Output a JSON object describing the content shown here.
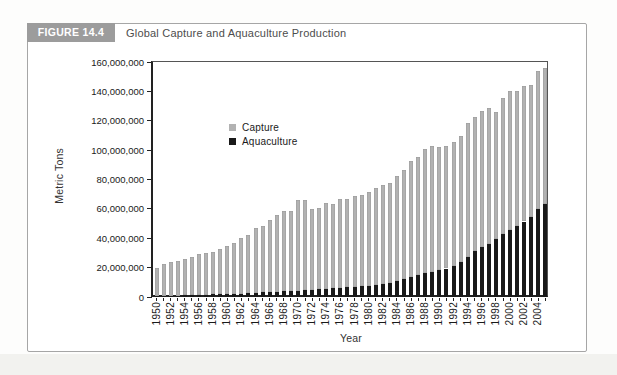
{
  "header": {
    "figure_label": "FIGURE 14.4",
    "title": "Global Capture and Aquaculture Production"
  },
  "chart_data": {
    "type": "bar",
    "stacked": true,
    "title": "Global Capture and Aquaculture Production",
    "xlabel": "Year",
    "ylabel": "Metric Tons",
    "ylim": [
      0,
      160000000
    ],
    "ytick_step": 20000000,
    "ytick_labels": [
      "0",
      "20,000,000",
      "40,000,000",
      "60,000,000",
      "80,000,000",
      "100,000,000",
      "120,000,000",
      "140,000,000",
      "160,000,000"
    ],
    "x_label_every": 2,
    "grid": false,
    "legend_position": "inside-upper-middle",
    "categories": [
      1950,
      1951,
      1952,
      1953,
      1954,
      1955,
      1956,
      1957,
      1958,
      1959,
      1960,
      1961,
      1962,
      1963,
      1964,
      1965,
      1966,
      1967,
      1968,
      1969,
      1970,
      1971,
      1972,
      1973,
      1974,
      1975,
      1976,
      1977,
      1978,
      1979,
      1980,
      1981,
      1982,
      1983,
      1984,
      1985,
      1986,
      1987,
      1988,
      1989,
      1990,
      1991,
      1992,
      1993,
      1994,
      1995,
      1996,
      1997,
      1998,
      1999,
      2000,
      2001,
      2002,
      2003,
      2004,
      2005
    ],
    "series": [
      {
        "name": "Capture",
        "color": "#b2b2b2",
        "values": [
          19200000,
          21500000,
          23000000,
          23600000,
          25000000,
          26200000,
          27600000,
          28000000,
          28500000,
          30400000,
          32400000,
          34900000,
          38100000,
          39700000,
          44200000,
          45400000,
          48900000,
          52300000,
          54800000,
          54300000,
          61400000,
          61600000,
          55200000,
          55200000,
          58300000,
          57700000,
          60500000,
          59700000,
          61600000,
          62000000,
          63800000,
          66100000,
          67500000,
          67600000,
          71600000,
          74500000,
          79200000,
          80100000,
          84600000,
          85500000,
          83900000,
          83400000,
          84200000,
          85700000,
          91100000,
          91400000,
          92500000,
          92900000,
          86800000,
          92800000,
          94600000,
          91900000,
          92200000,
          89500000,
          93900000,
          92800000
        ]
      },
      {
        "name": "Aquaculture",
        "color": "#191919",
        "values": [
          600000,
          700000,
          900000,
          1000000,
          1200000,
          1300000,
          1600000,
          1700000,
          1900000,
          2100000,
          2000000,
          2200000,
          2300000,
          2500000,
          2900000,
          3200000,
          3400000,
          3600000,
          3900000,
          4100000,
          4400000,
          4600000,
          5000000,
          5300000,
          5600000,
          5900000,
          6200000,
          6700000,
          7000000,
          7300000,
          7600000,
          8200000,
          8800000,
          9800000,
          11000000,
          12100000,
          13500000,
          14900000,
          16500000,
          17300000,
          18300000,
          19400000,
          21200000,
          24000000,
          27200000,
          31200000,
          33900000,
          36100000,
          39200000,
          43000000,
          45700000,
          48400000,
          51400000,
          54800000,
          59900000,
          63400000
        ]
      }
    ]
  }
}
